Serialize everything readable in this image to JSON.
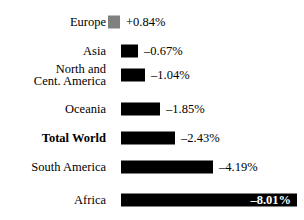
{
  "chart_data": {
    "type": "bar",
    "title": "",
    "subtitle": "",
    "xlabel": "",
    "ylabel": "",
    "orientation": "horizontal",
    "grid": false,
    "legend": false,
    "axis_visible": false,
    "value_unit": "%",
    "xlim": [
      -8.01,
      0.84
    ],
    "categories": [
      "Europe",
      "Asia",
      "North and\nCent. America",
      "Oceania",
      "Total World",
      "South America",
      "Africa"
    ],
    "values": [
      0.84,
      -0.67,
      -1.04,
      -1.85,
      -2.43,
      -4.19,
      -8.01
    ],
    "value_labels": [
      "+0.84%",
      "–0.67%",
      "–1.04%",
      "–1.85%",
      "–2.43%",
      "–4.19%",
      "–8.01%"
    ],
    "colors": {
      "positive": "#808080",
      "negative": "#000000",
      "inside_label": "#ffffff",
      "outside_label": "#000000",
      "background": "#ffffff"
    }
  },
  "rows": [
    {
      "label": "Europe",
      "value_label": "+0.84%",
      "bold": false,
      "bar_left": 108,
      "bar_width": 12,
      "bar_color": "positive",
      "label_inside": false,
      "value_left": 126
    },
    {
      "label": "Asia",
      "value_label": "–0.67%",
      "bold": false,
      "bar_left": 121,
      "bar_width": 17,
      "bar_color": "negative",
      "label_inside": false,
      "value_left": 144
    },
    {
      "label": "North and\nCent. America",
      "value_label": "–1.04%",
      "bold": false,
      "bar_left": 121,
      "bar_width": 24,
      "bar_color": "negative",
      "label_inside": false,
      "value_left": 151
    },
    {
      "label": "Oceania",
      "value_label": "–1.85%",
      "bold": false,
      "bar_left": 121,
      "bar_width": 39,
      "bar_color": "negative",
      "label_inside": false,
      "value_left": 166
    },
    {
      "label": "Total World",
      "value_label": "–2.43%",
      "bold": true,
      "bar_left": 121,
      "bar_width": 54,
      "bar_color": "negative",
      "label_inside": false,
      "value_left": 181
    },
    {
      "label": "South America",
      "value_label": "–4.19%",
      "bold": false,
      "bar_left": 121,
      "bar_width": 92,
      "bar_color": "negative",
      "label_inside": false,
      "value_left": 219
    },
    {
      "label": "Africa",
      "value_label": "–8.01%",
      "bold": false,
      "bar_left": 121,
      "bar_width": 176,
      "bar_color": "negative",
      "label_inside": true,
      "value_left": 239
    }
  ]
}
